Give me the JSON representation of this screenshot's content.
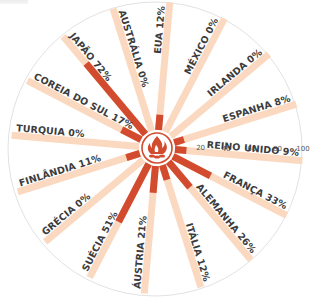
{
  "chart_data": {
    "type": "radial-bar",
    "title": "",
    "scale": {
      "min": 0,
      "max": 100,
      "ticks": [
        20,
        40,
        60,
        80,
        100
      ],
      "tick_axis": "REINO UNIDO"
    },
    "colors": {
      "track": "#fbd9c0",
      "value": "#d24b2e",
      "circle": "#e2e2e2",
      "label": "#3c3c3c"
    },
    "center_icon": "campfire-icon",
    "categories": [
      "EUA",
      "MÉXICO",
      "IRLANDA",
      "ESPANHA",
      "REINO UNIDO",
      "FRANÇA",
      "ALEMANHA",
      "ITÁLIA",
      "ÁUSTRIA",
      "SUÉCIA",
      "GRÉCIA",
      "FINLÂNDIA",
      "TURQUIA",
      "COREIA DO SUL",
      "JAPÃO",
      "AUSTRÁLIA"
    ],
    "values": [
      12,
      0,
      0,
      8,
      9,
      33,
      26,
      12,
      21,
      51,
      0,
      11,
      0,
      17,
      72,
      0
    ],
    "labels": [
      "EUA 12%",
      "MÉXICO 0%",
      "IRLANDA 0%",
      "ESPANHA 8%",
      "REINO UNIDO 9%",
      "FRANÇA 33%",
      "ALEMANHA 26%",
      "ITÁLIA 12%",
      "ÁUSTRIA 21%",
      "SUÉCIA 51%",
      "GRÉCIA 0%",
      "FINLÂNDIA 11%",
      "TURQUIA 0%",
      "COREIA DO SUL 17%",
      "JAPÃO 72%",
      "AUSTRÁLIA 0%"
    ],
    "angles_deg": [
      5,
      27.5,
      50,
      72.5,
      95,
      117.5,
      140,
      162.5,
      185,
      207.5,
      230,
      252.5,
      275,
      297.5,
      320,
      342.5
    ]
  }
}
